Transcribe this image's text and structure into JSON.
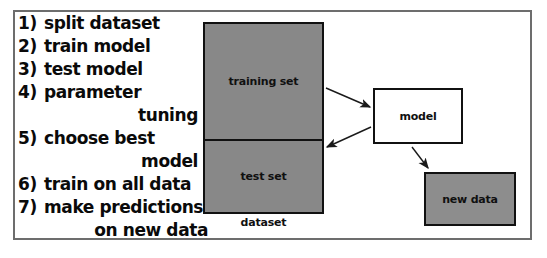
{
  "diagram": {
    "frame_border_color": "#6d6d6d",
    "fill_gray": "#888888",
    "stroke_color": "#111111",
    "steps": [
      {
        "num": "1)",
        "text": "split dataset",
        "cont": ""
      },
      {
        "num": "2)",
        "text": "train model",
        "cont": ""
      },
      {
        "num": "3)",
        "text": "test model",
        "cont": ""
      },
      {
        "num": "4)",
        "text": "parameter",
        "cont": "tuning"
      },
      {
        "num": "5)",
        "text": "choose best",
        "cont": "model"
      },
      {
        "num": "6)",
        "text": "train on all data",
        "cont": ""
      },
      {
        "num": "7)",
        "text": "make predictions",
        "cont": "on new data"
      }
    ],
    "boxes": {
      "training_set": "training set",
      "test_set": "test set",
      "dataset_caption": "dataset",
      "model": "model",
      "new_data": "new data"
    },
    "arrows": [
      {
        "name": "training-set-to-model",
        "from": "training set",
        "to": "model"
      },
      {
        "name": "model-to-test-set",
        "from": "model",
        "to": "test set"
      },
      {
        "name": "model-to-new-data",
        "from": "model",
        "to": "new data"
      }
    ]
  }
}
